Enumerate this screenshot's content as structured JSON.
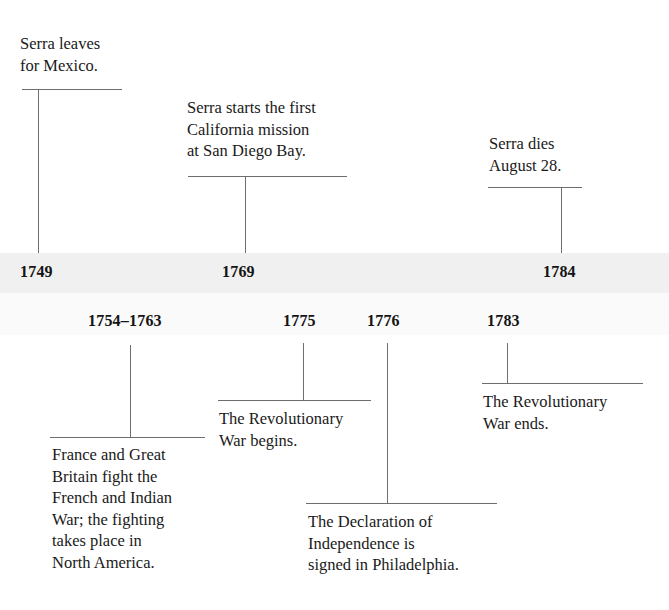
{
  "diagram": {
    "type": "timeline",
    "line_color": "#6e6e6e",
    "text_color": "#1a1a1a",
    "band_upper_color": "#f0f0f0",
    "band_lower_color": "#fafafa",
    "background_color": "#ffffff"
  },
  "upper_events": [
    {
      "year": "1749",
      "caption": "Serra leaves\nfor Mexico."
    },
    {
      "year": "1769",
      "caption": "Serra starts the first\nCalifornia mission\nat San Diego Bay."
    },
    {
      "year": "1784",
      "caption": "Serra dies\nAugust 28."
    }
  ],
  "lower_events": [
    {
      "year": "1754–1763",
      "caption": "France and Great\nBritain fight the\nFrench and Indian\nWar; the fighting\ntakes place in\nNorth America."
    },
    {
      "year": "1775",
      "caption": "The Revolutionary\nWar begins."
    },
    {
      "year": "1776",
      "caption": "The Declaration of\nIndependence is\nsigned in Philadelphia."
    },
    {
      "year": "1783",
      "caption": "The Revolutionary\nWar ends."
    }
  ]
}
